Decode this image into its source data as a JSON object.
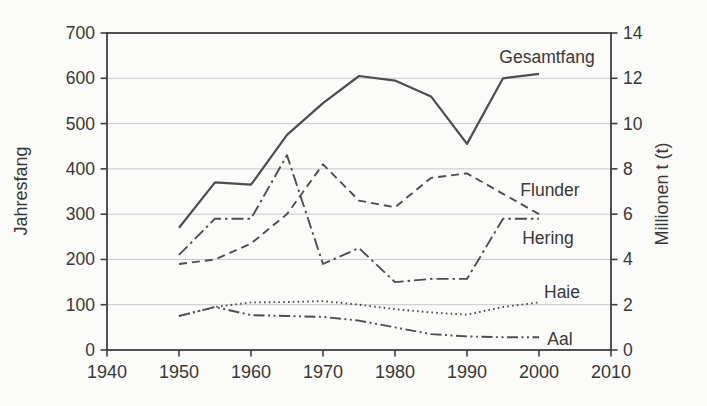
{
  "chart_data": {
    "type": "line",
    "title": "",
    "x_label": "",
    "x": [
      1950,
      1955,
      1960,
      1965,
      1970,
      1975,
      1980,
      1985,
      1990,
      1995,
      2000
    ],
    "series": [
      {
        "name": "Gesamtfang",
        "style": "solid",
        "values": [
          270,
          370,
          365,
          475,
          545,
          605,
          595,
          560,
          455,
          600,
          610
        ]
      },
      {
        "name": "Flunder",
        "style": "dashed",
        "values": [
          190,
          200,
          235,
          300,
          410,
          330,
          315,
          380,
          390,
          345,
          300
        ]
      },
      {
        "name": "Hering",
        "style": "dashdot",
        "values": [
          210,
          290,
          290,
          430,
          190,
          225,
          150,
          157,
          157,
          290,
          290
        ]
      },
      {
        "name": "Haie",
        "style": "dotted",
        "values": [
          75,
          95,
          105,
          106,
          108,
          100,
          90,
          83,
          78,
          95,
          105
        ]
      },
      {
        "name": "Aal",
        "style": "dashdotdot",
        "values": [
          75,
          95,
          77,
          75,
          73,
          65,
          50,
          35,
          30,
          28,
          28
        ]
      }
    ],
    "left_axis": {
      "label": "Jahresfang",
      "min": 0,
      "max": 700,
      "ticks": [
        0,
        100,
        200,
        300,
        400,
        500,
        600,
        700
      ]
    },
    "right_axis": {
      "label": "Millionen t (t)",
      "min": 0,
      "max": 14,
      "ticks": [
        0,
        2,
        4,
        6,
        8,
        10,
        12,
        14
      ]
    },
    "x_axis": {
      "label": "",
      "min": 1940,
      "max": 2010,
      "ticks": [
        1940,
        1950,
        1960,
        1970,
        1980,
        1990,
        2000,
        2010
      ]
    },
    "grid": true,
    "legend": "inline-labels",
    "annotations": [
      {
        "text": "Gesamtfang",
        "x": 547,
        "y": 63
      },
      {
        "text": "Flunder",
        "x": 550,
        "y": 196
      },
      {
        "text": "Hering",
        "x": 548,
        "y": 244
      },
      {
        "text": "Haie",
        "x": 562,
        "y": 298
      },
      {
        "text": "Aal",
        "x": 560,
        "y": 345
      }
    ],
    "colors": {
      "line": "#4d4d4d",
      "grid": "#c8c8c8",
      "frame": "#3f3f3f",
      "text": "#383838",
      "background": "#fbfbfa"
    }
  }
}
